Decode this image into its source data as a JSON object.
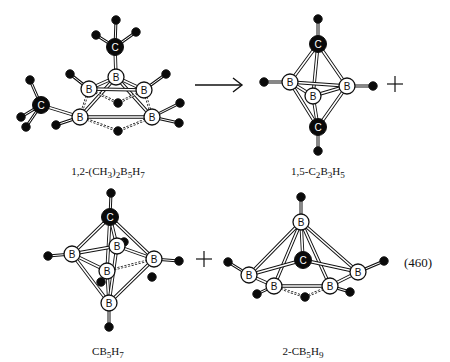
{
  "equation_number": "(460)",
  "colors": {
    "ink": "#111111",
    "paper": "#ffffff",
    "carbon": "#0a0a0a",
    "boron": "#ffffff",
    "hydrogen": "#0a0a0a"
  },
  "reaction": {
    "arrow": "→",
    "plus_signs": [
      "+",
      "+"
    ]
  },
  "molecules": [
    {
      "id": "dimethyl-pentaborane",
      "label_html": "1,2-(CH<sub>3</sub>)<sub>2</sub>B<sub>5</sub>H<sub>7</sub>",
      "label_text": "1,2-(CH3)2B5H7",
      "label_pos": [
        108,
        165
      ],
      "atoms": [
        {
          "el": "H",
          "x": 116,
          "y": 20
        },
        {
          "el": "H",
          "x": 96,
          "y": 35
        },
        {
          "el": "H",
          "x": 136,
          "y": 32
        },
        {
          "el": "C",
          "x": 115,
          "y": 47
        },
        {
          "el": "B",
          "x": 116,
          "y": 77
        },
        {
          "el": "B",
          "x": 89,
          "y": 89
        },
        {
          "el": "B",
          "x": 144,
          "y": 90
        },
        {
          "el": "B",
          "x": 80,
          "y": 117
        },
        {
          "el": "B",
          "x": 152,
          "y": 117
        },
        {
          "el": "C",
          "x": 41,
          "y": 105
        },
        {
          "el": "H",
          "x": 30,
          "y": 80
        },
        {
          "el": "H",
          "x": 21,
          "y": 117
        },
        {
          "el": "H",
          "x": 26,
          "y": 127
        },
        {
          "el": "H",
          "x": 70,
          "y": 74
        },
        {
          "el": "H",
          "x": 166,
          "y": 74
        },
        {
          "el": "H",
          "x": 56,
          "y": 125
        },
        {
          "el": "H",
          "x": 180,
          "y": 103
        },
        {
          "el": "H",
          "x": 179,
          "y": 123
        },
        {
          "el": "H",
          "x": 118,
          "y": 103
        },
        {
          "el": "H",
          "x": 118,
          "y": 131
        }
      ],
      "bonds": [
        [
          0,
          3,
          "s"
        ],
        [
          1,
          3,
          "s"
        ],
        [
          2,
          3,
          "s"
        ],
        [
          3,
          4,
          "d"
        ],
        [
          4,
          5,
          "d"
        ],
        [
          4,
          6,
          "d"
        ],
        [
          4,
          7,
          "d"
        ],
        [
          4,
          8,
          "d"
        ],
        [
          5,
          6,
          "d"
        ],
        [
          7,
          8,
          "d"
        ],
        [
          5,
          7,
          "h"
        ],
        [
          6,
          8,
          "h"
        ],
        [
          9,
          7,
          "d"
        ],
        [
          10,
          9,
          "s"
        ],
        [
          11,
          9,
          "s"
        ],
        [
          12,
          9,
          "s"
        ],
        [
          13,
          5,
          "s"
        ],
        [
          14,
          6,
          "s"
        ],
        [
          15,
          7,
          "s"
        ],
        [
          16,
          8,
          "s"
        ],
        [
          17,
          8,
          "s"
        ],
        [
          5,
          18,
          "h"
        ],
        [
          6,
          18,
          "h"
        ],
        [
          7,
          19,
          "h"
        ],
        [
          8,
          19,
          "h"
        ]
      ]
    },
    {
      "id": "closo-dicarbapentaborane",
      "label_html": "1,5-C<sub>2</sub>B<sub>3</sub>H<sub>5</sub>",
      "label_text": "1,5-C2B3H5",
      "label_pos": [
        318,
        165
      ],
      "atoms": [
        {
          "el": "H",
          "x": 318,
          "y": 19
        },
        {
          "el": "C",
          "x": 318,
          "y": 44
        },
        {
          "el": "B",
          "x": 290,
          "y": 82
        },
        {
          "el": "B",
          "x": 347,
          "y": 86
        },
        {
          "el": "B",
          "x": 313,
          "y": 96
        },
        {
          "el": "C",
          "x": 318,
          "y": 127
        },
        {
          "el": "H",
          "x": 318,
          "y": 151
        },
        {
          "el": "H",
          "x": 264,
          "y": 82
        },
        {
          "el": "H",
          "x": 373,
          "y": 86
        }
      ],
      "bonds": [
        [
          0,
          1,
          "s"
        ],
        [
          1,
          2,
          "d"
        ],
        [
          1,
          3,
          "d"
        ],
        [
          1,
          4,
          "d"
        ],
        [
          2,
          3,
          "d"
        ],
        [
          2,
          4,
          "d"
        ],
        [
          3,
          4,
          "d"
        ],
        [
          5,
          2,
          "d"
        ],
        [
          5,
          3,
          "d"
        ],
        [
          5,
          4,
          "d"
        ],
        [
          5,
          6,
          "s"
        ],
        [
          7,
          2,
          "s"
        ],
        [
          8,
          3,
          "s"
        ]
      ]
    },
    {
      "id": "carbahexaborane",
      "label_html": "CB<sub>5</sub>H<sub>7</sub>",
      "label_text": "CB5H7",
      "label_pos": [
        108,
        345
      ],
      "atoms": [
        {
          "el": "H",
          "x": 111,
          "y": 193
        },
        {
          "el": "C",
          "x": 110,
          "y": 217
        },
        {
          "el": "H",
          "x": 124,
          "y": 242
        },
        {
          "el": "B",
          "x": 117,
          "y": 246
        },
        {
          "el": "B",
          "x": 72,
          "y": 254
        },
        {
          "el": "B",
          "x": 154,
          "y": 259
        },
        {
          "el": "B",
          "x": 107,
          "y": 271
        },
        {
          "el": "B",
          "x": 109,
          "y": 303
        },
        {
          "el": "H",
          "x": 48,
          "y": 256
        },
        {
          "el": "H",
          "x": 179,
          "y": 261
        },
        {
          "el": "H",
          "x": 109,
          "y": 327
        },
        {
          "el": "H",
          "x": 152,
          "y": 277
        },
        {
          "el": "H",
          "x": 101,
          "y": 282
        }
      ],
      "bonds": [
        [
          0,
          1,
          "s"
        ],
        [
          1,
          3,
          "d"
        ],
        [
          1,
          4,
          "d"
        ],
        [
          1,
          5,
          "d"
        ],
        [
          1,
          6,
          "d"
        ],
        [
          4,
          3,
          "d"
        ],
        [
          3,
          5,
          "d"
        ],
        [
          4,
          6,
          "d"
        ],
        [
          6,
          5,
          "h"
        ],
        [
          7,
          4,
          "d"
        ],
        [
          7,
          5,
          "d"
        ],
        [
          7,
          6,
          "d"
        ],
        [
          7,
          3,
          "d"
        ],
        [
          8,
          4,
          "s"
        ],
        [
          9,
          5,
          "s"
        ],
        [
          10,
          7,
          "s"
        ],
        [
          3,
          2,
          "s"
        ]
      ]
    },
    {
      "id": "carbahexaborane-nido",
      "label_html": "2-CB<sub>5</sub>H<sub>9</sub>",
      "label_text": "2-CB5H9",
      "label_pos": [
        303,
        345
      ],
      "atoms": [
        {
          "el": "H",
          "x": 301,
          "y": 197
        },
        {
          "el": "B",
          "x": 301,
          "y": 222
        },
        {
          "el": "C",
          "x": 303,
          "y": 260
        },
        {
          "el": "B",
          "x": 249,
          "y": 275
        },
        {
          "el": "B",
          "x": 358,
          "y": 272
        },
        {
          "el": "B",
          "x": 274,
          "y": 286
        },
        {
          "el": "B",
          "x": 330,
          "y": 286
        },
        {
          "el": "H",
          "x": 228,
          "y": 262
        },
        {
          "el": "H",
          "x": 384,
          "y": 261
        },
        {
          "el": "H",
          "x": 257,
          "y": 294
        },
        {
          "el": "H",
          "x": 350,
          "y": 292
        },
        {
          "el": "H",
          "x": 305,
          "y": 297
        }
      ],
      "bonds": [
        [
          0,
          1,
          "s"
        ],
        [
          1,
          2,
          "d"
        ],
        [
          1,
          3,
          "d"
        ],
        [
          1,
          4,
          "d"
        ],
        [
          1,
          5,
          "d"
        ],
        [
          1,
          6,
          "d"
        ],
        [
          2,
          3,
          "d"
        ],
        [
          2,
          4,
          "d"
        ],
        [
          3,
          5,
          "d"
        ],
        [
          4,
          6,
          "d"
        ],
        [
          5,
          6,
          "d"
        ],
        [
          7,
          3,
          "s"
        ],
        [
          8,
          4,
          "s"
        ],
        [
          9,
          5,
          "s"
        ],
        [
          10,
          6,
          "s"
        ],
        [
          5,
          11,
          "h"
        ],
        [
          6,
          11,
          "h"
        ]
      ]
    }
  ],
  "arrow": {
    "x1": 195,
    "y1": 85,
    "x2": 242,
    "y2": 85
  },
  "plus": [
    {
      "x": 395,
      "y": 84
    },
    {
      "x": 204,
      "y": 259
    }
  ],
  "equation_number_pos": [
    404,
    255
  ]
}
